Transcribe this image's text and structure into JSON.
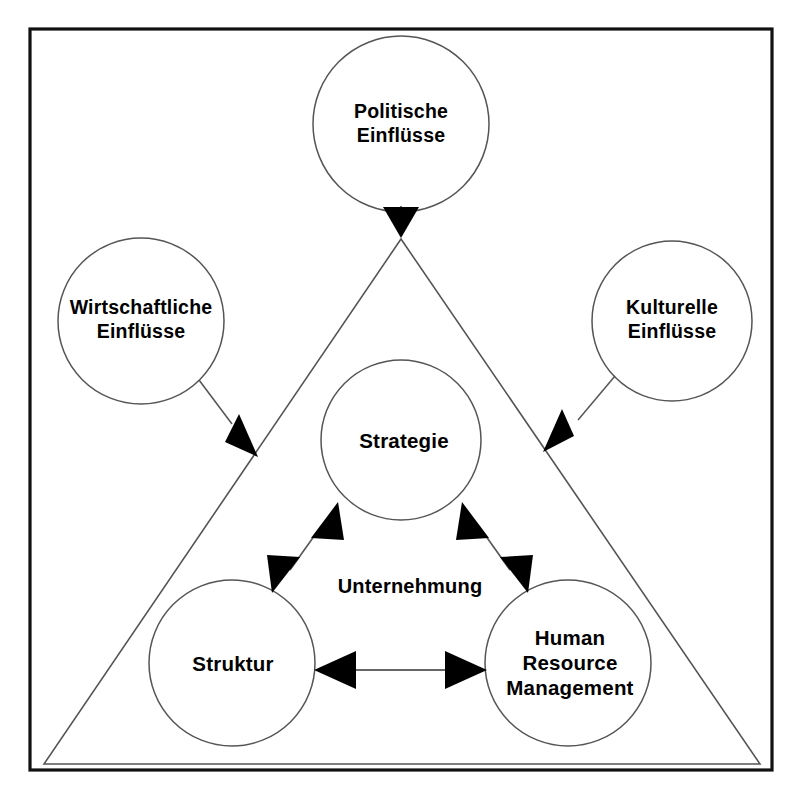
{
  "diagram": {
    "title_text": "",
    "frame": {
      "border_color": "#000000",
      "background_color": "#ffffff"
    },
    "triangle": {
      "name": "Unternehmung",
      "stroke_color": "#444444"
    },
    "center_label": "Unternehmung",
    "external_nodes": [
      {
        "id": "politische",
        "label": "Politische\nEinflüsse",
        "cx": 401,
        "cy": 124,
        "r": 88
      },
      {
        "id": "wirtschaftliche",
        "label": "Wirtschaftliche\nEinflüsse",
        "cx": 141,
        "cy": 321,
        "r": 83
      },
      {
        "id": "kulturelle",
        "label": "Kulturelle\nEinflüsse",
        "cx": 672,
        "cy": 321,
        "r": 80
      }
    ],
    "internal_nodes": [
      {
        "id": "strategie",
        "label": "Strategie",
        "cx": 401,
        "cy": 440,
        "r": 80
      },
      {
        "id": "struktur",
        "label": "Struktur",
        "cx": 232,
        "cy": 663,
        "r": 83
      },
      {
        "id": "hrm",
        "label": "Human\nResource\nManagement",
        "cx": 568,
        "cy": 663,
        "r": 83
      }
    ],
    "connections": [
      {
        "id": "politische-to-unternehmung",
        "from": "politische",
        "to": "unternehmung",
        "style": "single-arrow"
      },
      {
        "id": "wirtschaftliche-to-unternehmung",
        "from": "wirtschaftliche",
        "to": "unternehmung",
        "style": "single-arrow"
      },
      {
        "id": "kulturelle-to-unternehmung",
        "from": "kulturelle",
        "to": "unternehmung",
        "style": "single-arrow"
      },
      {
        "id": "strategie-struktur",
        "from": "strategie",
        "to": "struktur",
        "style": "double-arrow"
      },
      {
        "id": "strategie-hrm",
        "from": "strategie",
        "to": "hrm",
        "style": "double-arrow"
      },
      {
        "id": "struktur-hrm",
        "from": "struktur",
        "to": "hrm",
        "style": "double-arrow"
      }
    ]
  }
}
